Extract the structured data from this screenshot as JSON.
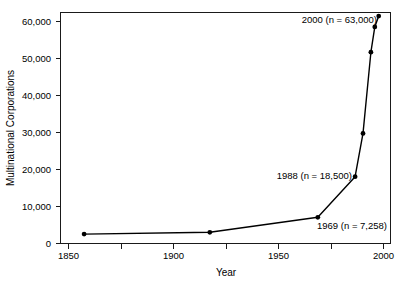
{
  "chart_data": {
    "type": "line",
    "title": "",
    "xlabel": "Year",
    "ylabel": "Multinational Corporations",
    "xlim": [
      1838,
      2006
    ],
    "ylim": [
      0,
      64000
    ],
    "grid": false,
    "legend": null,
    "x": [
      1850,
      1914,
      1969,
      1988,
      1992,
      1996,
      1998,
      2000
    ],
    "values": [
      2600,
      3100,
      7258,
      18500,
      30500,
      53000,
      60000,
      63000
    ],
    "series": [
      {
        "name": "Multinational Corporations",
        "x": [
          1850,
          1914,
          1969,
          1988,
          1992,
          1996,
          1998,
          2000
        ],
        "values": [
          2600,
          3100,
          7258,
          18500,
          30500,
          53000,
          60000,
          63000
        ]
      }
    ],
    "xticks": [
      1850,
      1900,
      1950,
      2000
    ],
    "xtick_labels": [
      "1850",
      "1900",
      "1950",
      "2000"
    ],
    "xminor_ticks": [
      1875,
      1925,
      1975
    ],
    "yticks": [
      0,
      10000,
      20000,
      30000,
      40000,
      50000,
      60000
    ],
    "ytick_labels": [
      "0",
      "10,000",
      "20,000",
      "30,000",
      "40,000",
      "50,000",
      "60,000"
    ],
    "annotations": [
      {
        "id": "ann-2000",
        "text": "2000 (n = 63,000)",
        "x": 2000,
        "y": 63000
      },
      {
        "id": "ann-1988",
        "text": "1988 (n = 18,500)",
        "x": 1988,
        "y": 18500
      },
      {
        "id": "ann-1969",
        "text": "1969 (n = 7,258)",
        "x": 1969,
        "y": 7258
      }
    ],
    "colors": {
      "line": "#000000",
      "marker": "#000000",
      "axis": "#1a1a1a",
      "background": "#ffffff"
    }
  },
  "axes": {
    "x_title": "Year",
    "y_title": "Multinational Corporations"
  },
  "ytick_labels": {
    "t0": "0",
    "t1": "10,000",
    "t2": "20,000",
    "t3": "30,000",
    "t4": "40,000",
    "t5": "50,000",
    "t6": "60,000"
  },
  "xtick_labels": {
    "t0": "1850",
    "t1": "1900",
    "t2": "1950",
    "t3": "2000"
  },
  "annotations": {
    "a0": "2000 (n = 63,000)",
    "a1": "1988 (n = 18,500)",
    "a2": "1969 (n = 7,258)"
  }
}
